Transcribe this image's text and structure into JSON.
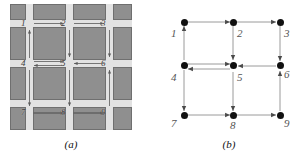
{
  "figure": {
    "panels": [
      {
        "id": "a",
        "caption": "(a)",
        "type": "street-grid-photo",
        "description": "Aerial view of a city block grid with one-way street directions marked by arrows at nine numbered intersections",
        "intersection_labels": [
          "1",
          "2",
          "3",
          "4",
          "5",
          "6",
          "7",
          "8",
          "9"
        ],
        "colors": {
          "block": "#8f8f8f",
          "street": "#e2e2e2",
          "backdrop": "#d9d9d9",
          "arrow": "#5a5a5a",
          "label": "#3a3a3a"
        }
      },
      {
        "id": "b",
        "caption": "(b)",
        "type": "directed-graph",
        "description": "Directed graph representation of the street grid with nine vertices",
        "node_labels": [
          "1",
          "2",
          "3",
          "4",
          "5",
          "6",
          "7",
          "8",
          "9"
        ],
        "colors": {
          "node": "#111111",
          "edge": "#8a8a8a",
          "label": "#555555"
        }
      }
    ]
  },
  "graph_data": {
    "type": "directed-graph",
    "nodes": [
      {
        "id": "1",
        "label": "1",
        "row": 0,
        "col": 0
      },
      {
        "id": "2",
        "label": "2",
        "row": 0,
        "col": 1
      },
      {
        "id": "3",
        "label": "3",
        "row": 0,
        "col": 2
      },
      {
        "id": "4",
        "label": "4",
        "row": 1,
        "col": 0
      },
      {
        "id": "5",
        "label": "5",
        "row": 1,
        "col": 1
      },
      {
        "id": "6",
        "label": "6",
        "row": 1,
        "col": 2
      },
      {
        "id": "7",
        "label": "7",
        "row": 2,
        "col": 0
      },
      {
        "id": "8",
        "label": "8",
        "row": 2,
        "col": 1
      },
      {
        "id": "9",
        "label": "9",
        "row": 2,
        "col": 2
      }
    ],
    "edges": [
      {
        "from": "1",
        "to": "2",
        "direction": "right"
      },
      {
        "from": "2",
        "to": "3",
        "direction": "right"
      },
      {
        "from": "4",
        "to": "1",
        "direction": "up"
      },
      {
        "from": "2",
        "to": "5",
        "direction": "down"
      },
      {
        "from": "3",
        "to": "6",
        "direction": "down"
      },
      {
        "from": "4",
        "to": "5",
        "direction": "right"
      },
      {
        "from": "5",
        "to": "4",
        "direction": "left"
      },
      {
        "from": "6",
        "to": "5",
        "direction": "left"
      },
      {
        "from": "4",
        "to": "7",
        "direction": "down"
      },
      {
        "from": "5",
        "to": "8",
        "direction": "down"
      },
      {
        "from": "9",
        "to": "6",
        "direction": "up"
      },
      {
        "from": "7",
        "to": "8",
        "direction": "right"
      },
      {
        "from": "8",
        "to": "9",
        "direction": "right"
      }
    ]
  }
}
